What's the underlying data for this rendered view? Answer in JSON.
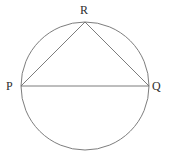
{
  "figure": {
    "background_color": "#ffffff",
    "stroke_color": "#6e6e6e",
    "label_color": "#2e2e2e",
    "stroke_width": 0.9,
    "circle": {
      "name": "circumscribed-circle",
      "center_x": 85,
      "center_y": 86,
      "radius": 64
    },
    "points": [
      {
        "id": "P",
        "label": "P",
        "x": 21,
        "y": 86
      },
      {
        "id": "Q",
        "label": "Q",
        "x": 149,
        "y": 86
      },
      {
        "id": "R",
        "label": "R",
        "x": 85,
        "y": 22
      }
    ],
    "segments": [
      {
        "id": "PQ",
        "from": "P",
        "to": "Q",
        "name": "diameter-segment-pq"
      },
      {
        "id": "PR",
        "from": "P",
        "to": "R",
        "name": "chord-segment-pr"
      },
      {
        "id": "RQ",
        "from": "R",
        "to": "Q",
        "name": "chord-segment-rq"
      }
    ]
  }
}
